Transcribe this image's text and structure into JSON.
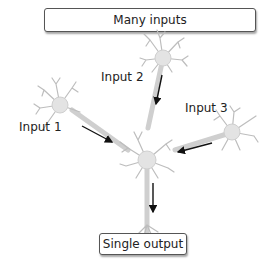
{
  "diagram": {
    "top_box": {
      "label": "Many inputs"
    },
    "bottom_box": {
      "label": "Single output"
    },
    "inputs": [
      {
        "label": "Input 1"
      },
      {
        "label": "Input 2"
      },
      {
        "label": "Input 3"
      }
    ],
    "colors": {
      "neuron_fill": "#e6e6e6",
      "neuron_stroke": "#c8c8c8",
      "arrow": "#111111",
      "box_border": "#555555"
    }
  }
}
